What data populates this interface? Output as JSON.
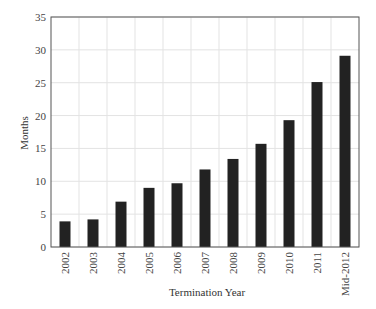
{
  "chart_data": {
    "type": "bar",
    "title": "",
    "xlabel": "Termination Year",
    "ylabel": "Months",
    "categories": [
      "2002",
      "2003",
      "2004",
      "2005",
      "2006",
      "2007",
      "2008",
      "2009",
      "2010",
      "2011",
      "Mid-2012"
    ],
    "values": [
      3.9,
      4.2,
      6.9,
      9.0,
      9.7,
      11.8,
      13.4,
      15.7,
      19.3,
      25.1,
      29.1
    ],
    "ylim": [
      0,
      35
    ],
    "yticks": [
      0,
      5,
      10,
      15,
      20,
      25,
      30,
      35
    ],
    "grid": true,
    "legend": null,
    "bar_color": "#222222",
    "grid_color": "#e3e3e3",
    "axis_color": "#555555"
  }
}
